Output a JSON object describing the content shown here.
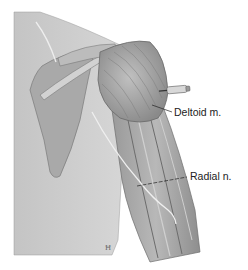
{
  "figure": {
    "labels": [
      {
        "id": "deltoid",
        "text": "Deltoid m."
      },
      {
        "id": "radial",
        "text": "Radial n."
      }
    ],
    "signature": "Ħ",
    "colors": {
      "background": "#ffffff",
      "skin": "#c9c9c9",
      "muscle": "#a8a8a8",
      "shadow": "#7a7a7a",
      "nerve": "#eeeeee",
      "leader": "#222222",
      "syringe": "#d8d8d8"
    }
  }
}
